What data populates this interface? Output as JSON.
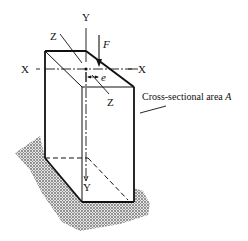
{
  "diagram": {
    "type": "eccentric-axial-load-column",
    "axis_labels": {
      "y_top": "Y",
      "y_bottom": "Y",
      "x_left": "X",
      "x_right": "X",
      "z_top": "Z",
      "z_bottom": "Z"
    },
    "force_label": "F",
    "eccentricity_label": "e",
    "area_caption": "Cross-sectional area",
    "area_symbol": "A",
    "colors": {
      "line": "#111111",
      "ground_shading": "#9a9a9a"
    }
  }
}
